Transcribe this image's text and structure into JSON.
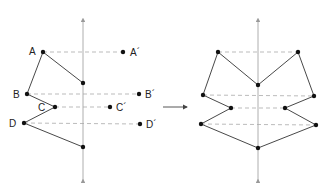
{
  "diagram": {
    "colors": {
      "line": "#333333",
      "dash": "#aaaaaa",
      "axis": "#999999",
      "point": "#111111"
    },
    "left": {
      "labels": {
        "A": "A",
        "B": "B",
        "C": "C",
        "D": "D",
        "A_prime": "A´",
        "B_prime": "B´",
        "C_prime": "C´",
        "D_prime": "D´"
      }
    },
    "arrow_label": ""
  }
}
